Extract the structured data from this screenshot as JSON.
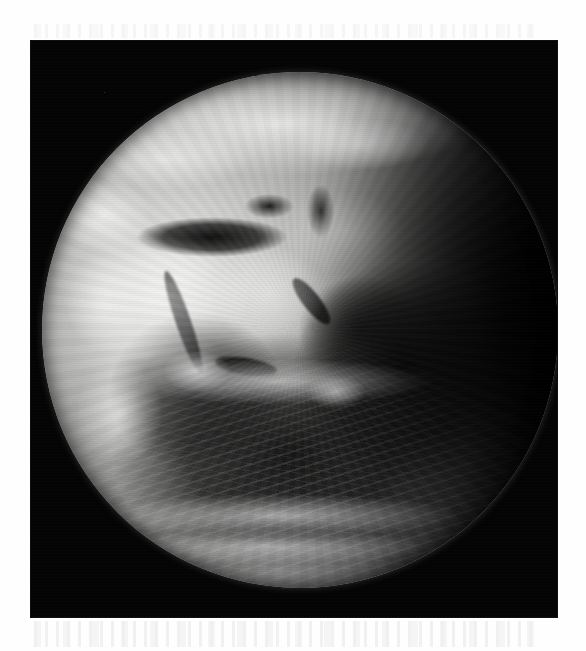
{
  "page": {
    "background_color": "#fefefe",
    "panel_background_color": "#040404",
    "caption": ""
  },
  "image": {
    "title": "Earth full-disc satellite view",
    "alt_text": "Black and white satellite photograph of the full disc of Earth",
    "kind": "grayscale-satellite-photograph",
    "palette": {
      "space": "#040404",
      "disc_highlight": "#e8e8e6",
      "disc_midtone": "#949492",
      "disc_shadow": "#121212",
      "paper": "#fefefe"
    },
    "geometry": {
      "panel_left_px": 31,
      "panel_top_px": 41,
      "panel_width_px": 526,
      "panel_height_px": 576,
      "disc_center_x_px": 300,
      "disc_center_y_px": 330,
      "disc_radius_px": 258
    },
    "features": [
      {
        "name": "mediterranean-sea",
        "tone": "dark",
        "label": "Mediterranean Sea"
      },
      {
        "name": "black-sea",
        "tone": "dark",
        "label": "Black Sea"
      },
      {
        "name": "caspian-sea",
        "tone": "dark",
        "label": "Caspian Sea"
      },
      {
        "name": "red-sea",
        "tone": "dark",
        "label": "Red Sea"
      },
      {
        "name": "persian-gulf",
        "tone": "dark",
        "label": "Persian Gulf"
      },
      {
        "name": "gulf-of-aden",
        "tone": "dark",
        "label": "Gulf of Aden"
      },
      {
        "name": "sahara-desert",
        "tone": "bright",
        "label": "Sahara Desert"
      },
      {
        "name": "arabian-peninsula",
        "tone": "bright",
        "label": "Arabian Peninsula"
      },
      {
        "name": "atlantic-ocean",
        "tone": "dark",
        "label": "Atlantic Ocean"
      },
      {
        "name": "indian-ocean",
        "tone": "dark",
        "label": "Indian Ocean"
      },
      {
        "name": "itcz-cloud-band",
        "tone": "bright",
        "label": "Equatorial cloud band"
      },
      {
        "name": "southern-frontal-bands",
        "tone": "bright",
        "label": "Southern frontal cloud bands"
      },
      {
        "name": "northern-cloud-sheet",
        "tone": "bright",
        "label": "Northern cloud sheet"
      },
      {
        "name": "terminator",
        "tone": "shadow",
        "label": "Day/night terminator"
      }
    ]
  }
}
